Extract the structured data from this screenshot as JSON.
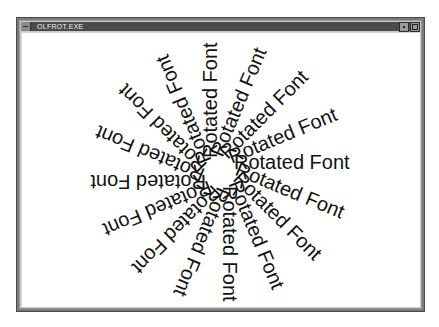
{
  "window": {
    "title": "OLFROT.EXE",
    "buttons": {
      "minimize": "minimize-button",
      "maximize": "maximize-button"
    }
  },
  "drawing": {
    "text": "Rotated Font",
    "ray_count": 16,
    "angle_step_degrees": 22.5,
    "center": {
      "x": 220,
      "y": 172
    },
    "start_radius_px": 14,
    "text_color": "#111111",
    "background_color": "#ffffff",
    "rays": [
      {
        "angle": 0,
        "label": "Rotated Font"
      },
      {
        "angle": 22.5,
        "label": "Rotated Font"
      },
      {
        "angle": 45,
        "label": "Rotated Font"
      },
      {
        "angle": 67.5,
        "label": "Rotated Font"
      },
      {
        "angle": 90,
        "label": "Rotated Font"
      },
      {
        "angle": 112.5,
        "label": "Rotated Font"
      },
      {
        "angle": 135,
        "label": "Rotated Font"
      },
      {
        "angle": 157.5,
        "label": "Rotated Font"
      },
      {
        "angle": 180,
        "label": "Rotated Font"
      },
      {
        "angle": 202.5,
        "label": "Rotated Font"
      },
      {
        "angle": 225,
        "label": "Rotated Font"
      },
      {
        "angle": 247.5,
        "label": "Rotated Font"
      },
      {
        "angle": 270,
        "label": "Rotated Font"
      },
      {
        "angle": 292.5,
        "label": "Rotated Font"
      },
      {
        "angle": 315,
        "label": "Rotated Font"
      },
      {
        "angle": 337.5,
        "label": "Rotated Font"
      }
    ]
  },
  "colors": {
    "titlebar": "#4b4b4b",
    "title_text": "#f0f0f0",
    "frame": "#7a7a7a"
  }
}
